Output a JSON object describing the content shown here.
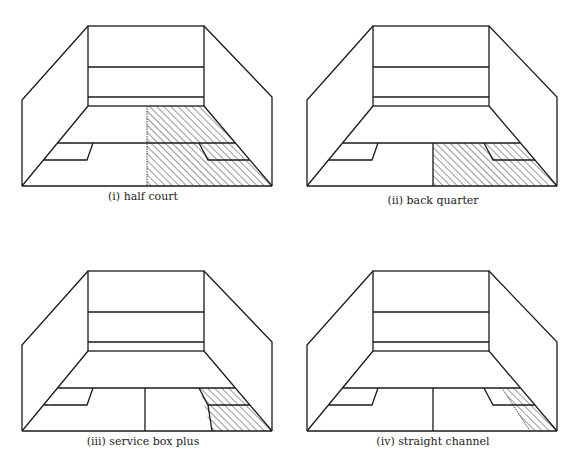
{
  "figure": {
    "panels": [
      {
        "id": "i",
        "caption": "(i) half court",
        "zone": "half-court",
        "offset": [
          0,
          0
        ],
        "caption_pos": [
          143,
          190
        ]
      },
      {
        "id": "ii",
        "caption": "(ii) back quarter",
        "zone": "back-quarter",
        "offset": [
          285,
          0
        ],
        "caption_pos": [
          433,
          194
        ]
      },
      {
        "id": "iii",
        "caption": "(iii) service box plus",
        "zone": "service-box-plus",
        "offset": [
          0,
          245
        ],
        "caption_pos": [
          143,
          435
        ]
      },
      {
        "id": "iv",
        "caption": "(iv) straight channel",
        "zone": "straight-channel",
        "offset": [
          285,
          245
        ],
        "caption_pos": [
          433,
          435
        ]
      }
    ],
    "colors": {
      "line": "#1a1a1a",
      "hatch": "#1a1a1a",
      "background": "#ffffff"
    }
  }
}
